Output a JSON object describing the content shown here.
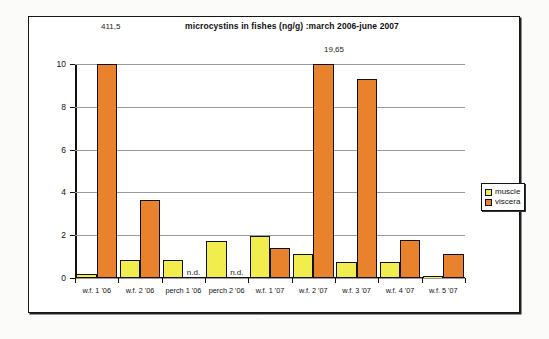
{
  "chart_data": {
    "type": "bar",
    "title": "microcystins in fishes (ng/g) :march 2006-june 2007",
    "xlabel": "",
    "ylabel": "",
    "ylim": [
      0,
      10
    ],
    "yticks": [
      "0",
      "2",
      "4",
      "6",
      "8",
      "10"
    ],
    "grid": true,
    "legend_position": "right",
    "categories": [
      "w.f. 1 '06",
      "w.f. 2 '06",
      "perch 1 '06",
      "perch 2 '06",
      "w.f. 1 '07",
      "w.f. 2 '07",
      "w.f. 3 '07",
      "w.f. 4 '07",
      "w.f. 5 '07"
    ],
    "series": [
      {
        "name": "muscle",
        "color": "#f2ed4e",
        "values": [
          0.2,
          0.85,
          0.85,
          1.72,
          1.98,
          1.1,
          0.75,
          0.75,
          0.1
        ]
      },
      {
        "name": "viscera",
        "color": "#e8822c",
        "values": [
          10,
          3.65,
          null,
          null,
          1.38,
          10,
          9.3,
          1.78,
          1.1
        ]
      }
    ],
    "missing_label": "n.d.",
    "annotations": [
      {
        "text": "411,5",
        "note": "actual value of w.f. 1 '06 viscera bar, clipped at axis max"
      },
      {
        "text": "19,65",
        "note": "actual value of w.f. 2 '07 viscera bar, clipped at axis max"
      }
    ]
  },
  "legend": {
    "items": [
      {
        "label": "muscle"
      },
      {
        "label": "viscera"
      }
    ]
  },
  "colors": {
    "muscle": "#f2ed4e",
    "viscera": "#e8822c",
    "axis": "#111111",
    "grid": "#9a9a9a",
    "paper": "#fbfbf9"
  }
}
